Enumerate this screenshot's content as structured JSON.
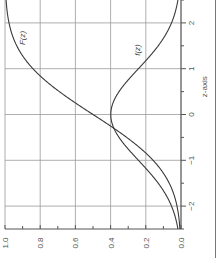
{
  "chart_data": {
    "type": "line",
    "orientation": "rotated-90-ccw",
    "title": "",
    "xlabel": "z-axis",
    "ylabel": "",
    "xlim": [
      -2.5,
      2.5
    ],
    "ylim": [
      0.0,
      1.0
    ],
    "x_ticks": [
      -2,
      -1,
      0,
      1,
      2
    ],
    "x_tick_labels": [
      "−2",
      "−1",
      "0",
      "1",
      "2"
    ],
    "x_minor_step": 0.5,
    "y_ticks": [
      0.0,
      0.2,
      0.4,
      0.6,
      0.8,
      1.0
    ],
    "y_tick_labels": [
      "0.0",
      "0.2",
      "0.4",
      "0.6",
      "0.8",
      "1.0"
    ],
    "y_minor_step": 0.1,
    "grid": true,
    "series": [
      {
        "name": "F(z)",
        "description": "standard normal cumulative distribution",
        "x": [
          -2.5,
          -2.0,
          -1.5,
          -1.0,
          -0.5,
          0.0,
          0.5,
          1.0,
          1.5,
          2.0,
          2.5
        ],
        "values": [
          0.006,
          0.023,
          0.067,
          0.159,
          0.309,
          0.5,
          0.691,
          0.841,
          0.933,
          0.977,
          0.994
        ]
      },
      {
        "name": "f(z)",
        "description": "standard normal density",
        "x": [
          -2.5,
          -2.0,
          -1.5,
          -1.0,
          -0.5,
          0.0,
          0.5,
          1.0,
          1.5,
          2.0,
          2.5
        ],
        "values": [
          0.018,
          0.054,
          0.13,
          0.242,
          0.352,
          0.399,
          0.352,
          0.242,
          0.13,
          0.054,
          0.018
        ]
      }
    ],
    "annotations": [
      {
        "text": "F(z)",
        "near_series": "F(z)",
        "at_z": 2.0
      },
      {
        "text": "f(z)",
        "near_series": "f(z)",
        "at_z": 1.5
      }
    ]
  }
}
